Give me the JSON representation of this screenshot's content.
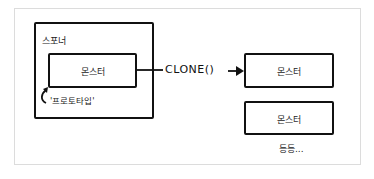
{
  "diagram": {
    "spawner": {
      "label": "스포너"
    },
    "prototype_monster": {
      "label": "몬스터"
    },
    "prototype_caption": "'프로토타입'",
    "method_label": "CLONE()",
    "clones": [
      {
        "label": "몬스터"
      },
      {
        "label": "몬스터"
      }
    ],
    "etc_label": "등등...",
    "colors": {
      "stroke": "#111111",
      "frame": "#dcdcdc",
      "background": "#ffffff"
    }
  }
}
